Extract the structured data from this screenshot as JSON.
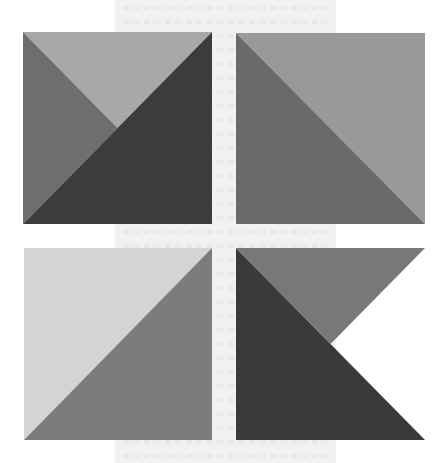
{
  "figure": {
    "background": {
      "page_color": "#ffffff",
      "band_color": "#f1f1f1"
    },
    "panels": [
      {
        "name": "top-left",
        "regions": [
          {
            "name": "top-triangle",
            "color": "#a8a8a8",
            "vertices": [
              "top-left",
              "top-right",
              "center"
            ]
          },
          {
            "name": "left-triangle",
            "color": "#6e6e6e",
            "vertices": [
              "top-left",
              "center",
              "bottom-left"
            ]
          },
          {
            "name": "lower-right-half",
            "color": "#3c3c3c",
            "vertices": [
              "top-right",
              "bottom-right",
              "bottom-left"
            ]
          }
        ]
      },
      {
        "name": "top-right",
        "regions": [
          {
            "name": "upper-right-half",
            "color": "#999999",
            "vertices": [
              "top-left",
              "top-right",
              "bottom-right"
            ]
          },
          {
            "name": "lower-left-half",
            "color": "#6a6a6a",
            "vertices": [
              "top-left",
              "bottom-left",
              "bottom-right"
            ]
          }
        ]
      },
      {
        "name": "bottom-left",
        "regions": [
          {
            "name": "upper-left-half",
            "color": "#d4d4d4",
            "vertices": [
              "top-left",
              "top-right",
              "bottom-left"
            ]
          },
          {
            "name": "lower-right-half",
            "color": "#7c7c7c",
            "vertices": [
              "top-right",
              "bottom-right",
              "bottom-left"
            ]
          }
        ]
      },
      {
        "name": "bottom-right",
        "regions": [
          {
            "name": "lower-left-half",
            "color": "#3a3a3a",
            "vertices": [
              "top-left",
              "bottom-left",
              "bottom-right"
            ]
          },
          {
            "name": "top-triangle",
            "color": "#787878",
            "vertices": [
              "top-left",
              "top-right",
              "center"
            ]
          }
        ]
      }
    ]
  }
}
